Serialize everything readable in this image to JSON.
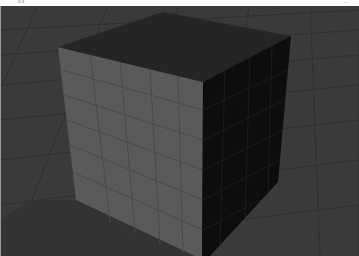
{
  "header": {
    "left_label": "33",
    "right_label": "…"
  },
  "scene": {
    "object": "cube",
    "colors": {
      "floor": "#3a3a3a",
      "floor_grid": "#2e2e2e",
      "top_face": "#252525",
      "left_face": "#5a5a5a",
      "left_face_grid": "#4a4a4a",
      "right_face": "#0d0d0d",
      "right_face_grid": "#1c1c1c"
    },
    "vertices": {
      "top_back": [
        163,
        12
      ],
      "top_left": [
        58,
        47
      ],
      "top_right": [
        291,
        36
      ],
      "top_front": [
        203,
        82
      ],
      "left_bottom": [
        76,
        200
      ],
      "front_bottom": [
        202,
        256
      ],
      "right_bottom": [
        278,
        182
      ],
      "right_bottom_end": [
        210,
        256
      ]
    }
  }
}
